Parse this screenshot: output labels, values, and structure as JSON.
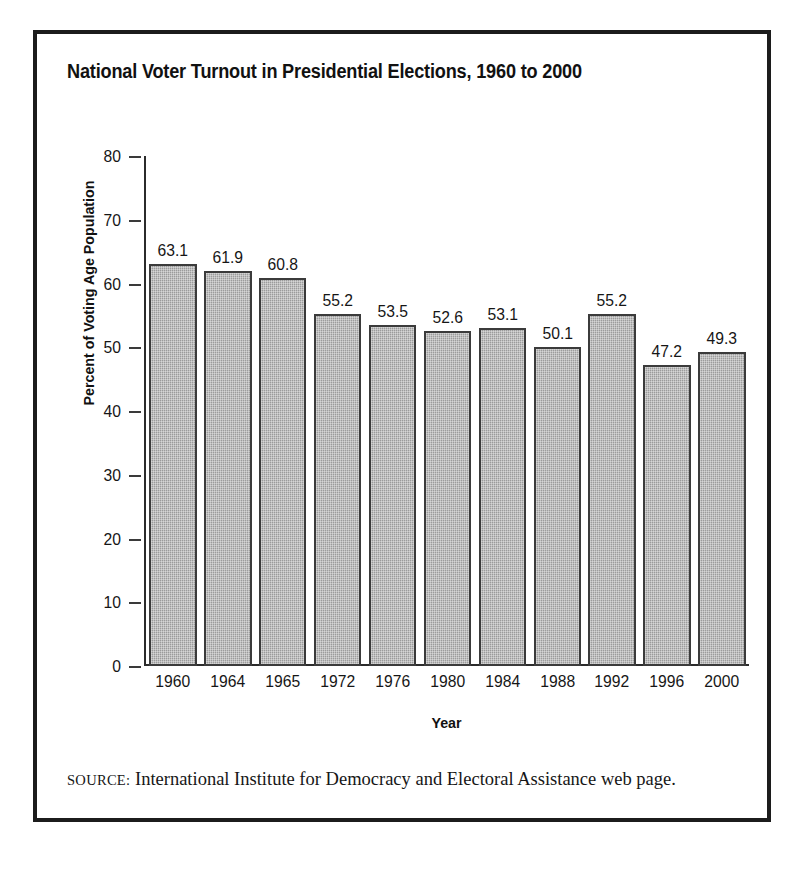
{
  "figure": {
    "title": "National Voter Turnout in Presidential Elections, 1960 to 2000",
    "source_label": "SOURCE:",
    "source_text": " International Institute for Democracy and Electoral Assistance web page."
  },
  "chart_data": {
    "type": "bar",
    "title": "National Voter Turnout in Presidential Elections, 1960 to 2000",
    "xlabel": "Year",
    "ylabel": "Percent of Voting Age Population",
    "categories": [
      "1960",
      "1964",
      "1965",
      "1972",
      "1976",
      "1980",
      "1984",
      "1988",
      "1992",
      "1996",
      "2000"
    ],
    "values": [
      63.1,
      61.9,
      60.8,
      55.2,
      53.5,
      52.6,
      53.1,
      50.1,
      55.2,
      47.2,
      49.3
    ],
    "value_labels": [
      "63.1",
      "61.9",
      "60.8",
      "55.2",
      "53.5",
      "52.6",
      "53.1",
      "50.1",
      "55.2",
      "47.2",
      "49.3"
    ],
    "ylim": [
      0,
      80
    ],
    "ytick_labels": [
      "80",
      "70",
      "60",
      "50",
      "40",
      "30",
      "20",
      "10",
      "0"
    ],
    "ytick_values": [
      80,
      70,
      60,
      50,
      40,
      30,
      20,
      10,
      0
    ],
    "grid": false,
    "legend": "none",
    "bar_fill_color": "#a5a5a5",
    "bar_border_color": "#3b3b3b",
    "axis_color": "#2b2b2b",
    "text_color": "#161616"
  }
}
